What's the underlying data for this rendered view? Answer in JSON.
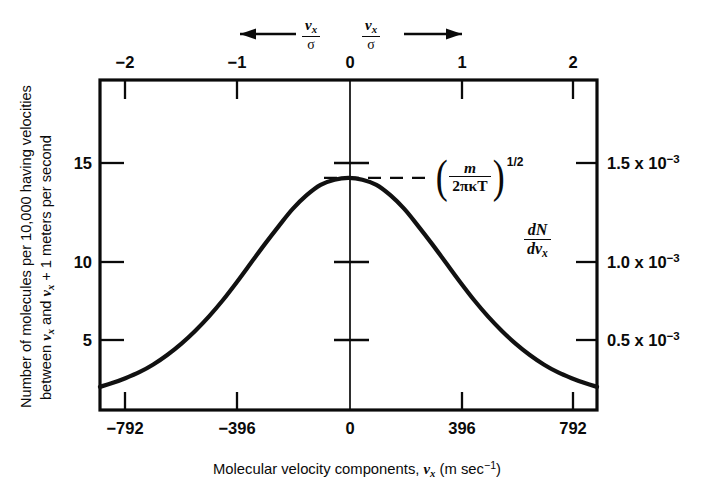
{
  "chart_data": {
    "type": "line",
    "title": "",
    "xlabel": "Molecular velocity components, v_x (m sec^-1)",
    "ylabel_line1": "Number of molecules per 10,000 having velocities",
    "ylabel_line2": "between v_x and v_x + 1 meters per second",
    "xlabel_parts": {
      "text_before": "Molecular velocity components, ",
      "symbol": "v",
      "symbol_sub": "x",
      "unit_open": " (m sec",
      "unit_exp": "−1",
      "unit_close": ")"
    },
    "ylabel_parts": {
      "line1": "Number of molecules per 10,000 having velocities",
      "line2_before": "between ",
      "line2_sym1": "v",
      "line2_sub1": "x",
      "line2_mid": " and ",
      "line2_sym2": "v",
      "line2_sub2": "x",
      "line2_after": " + 1 meters per second"
    },
    "xlim": [
      -891,
      891
    ],
    "ylim": [
      0,
      19.2
    ],
    "x_ticks": [
      -792,
      -396,
      0,
      396,
      792
    ],
    "x_tick_labels": [
      "−792",
      "−396",
      "0",
      "396",
      "792"
    ],
    "x_minor_ticks": [
      -594,
      -198,
      198,
      594
    ],
    "top_axis": {
      "label_numerator": "v",
      "label_sub": "x",
      "label_denominator": "σ",
      "ticks": [
        -2,
        -1,
        0,
        1,
        2
      ],
      "tick_labels": [
        "−2",
        "−1",
        "0",
        "1",
        "2"
      ],
      "unit_in_x": 396,
      "arrow_left": "←",
      "arrow_right": "→"
    },
    "y_ticks_left": [
      5,
      10,
      15
    ],
    "y_tick_labels_left": [
      "5",
      "10",
      "15"
    ],
    "y_ticks_right_values": [
      5,
      10,
      15
    ],
    "y_tick_labels_right": [
      "0.5 x 10−3",
      "1.0 x 10−3",
      "1.5 x 10−3"
    ],
    "right_axis_label": {
      "numerator_d": "d",
      "numerator_N": "N",
      "denominator_d": "d",
      "denominator_v": "v",
      "denominator_sub": "x"
    },
    "peak_value": 13.5,
    "peak_x": 0,
    "sigma": 396,
    "grid": false,
    "legend_position": "none",
    "annotation": {
      "formula_numerator": "m",
      "formula_denominator": "2πκT",
      "formula_exponent": "1/2",
      "paren_open": "(",
      "paren_close": ")",
      "dashed_leader": true,
      "dashed_leader_y": 13.5
    },
    "series": [
      {
        "name": "Maxwell-Boltzmann distribution of v_x",
        "x": [
          -891,
          -850,
          -800,
          -750,
          -700,
          -650,
          -600,
          -550,
          -500,
          -450,
          -400,
          -350,
          -300,
          -250,
          -200,
          -150,
          -100,
          -50,
          0,
          50,
          100,
          150,
          200,
          250,
          300,
          350,
          400,
          450,
          500,
          550,
          600,
          650,
          700,
          750,
          800,
          850,
          891
        ],
        "y": [
          1.35,
          1.55,
          1.85,
          2.2,
          2.65,
          3.2,
          3.85,
          4.6,
          5.45,
          6.4,
          7.45,
          8.55,
          9.65,
          10.7,
          11.7,
          12.5,
          13.1,
          13.4,
          13.5,
          13.4,
          13.1,
          12.5,
          11.7,
          10.7,
          9.65,
          8.55,
          7.45,
          6.4,
          5.45,
          4.6,
          3.85,
          3.2,
          2.65,
          2.2,
          1.85,
          1.55,
          1.35
        ]
      }
    ]
  },
  "colors": {
    "ink": "#0a0a0a",
    "background": "#ffffff",
    "curve": "#111111"
  }
}
